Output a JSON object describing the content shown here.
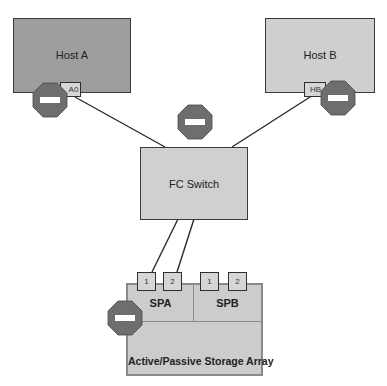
{
  "hosts": [
    {
      "id": "host-a",
      "label": "Host A",
      "hba_label": "A0",
      "fill": "#9e9e9e"
    },
    {
      "id": "host-b",
      "label": "Host B",
      "hba_label": "HB",
      "fill": "#cfcfcf"
    }
  ],
  "switch": {
    "label": "FC Switch",
    "fill": "#d0d0d0"
  },
  "array": {
    "label": "Active/Passive Storage Array",
    "fill": "#cccccc",
    "processors": [
      {
        "label": "SPA",
        "ports": [
          "1",
          "2"
        ]
      },
      {
        "label": "SPB",
        "ports": [
          "1",
          "2"
        ]
      }
    ]
  },
  "stop_signs": {
    "fill": "#6e6e6e",
    "count": 4,
    "locations": [
      "host-a-hba",
      "host-b-hba",
      "fc-switch",
      "storage-array-spa"
    ]
  },
  "colors": {
    "line": "#2a2a2a",
    "border": "#3a3a3a"
  }
}
